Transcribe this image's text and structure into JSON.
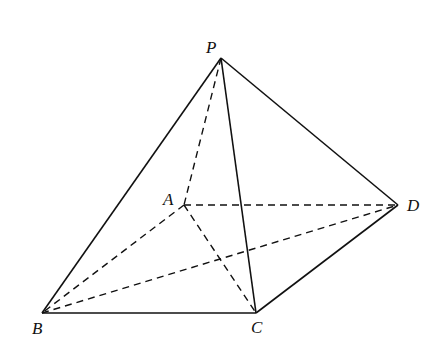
{
  "diagram": {
    "points": {
      "P": {
        "label": "P",
        "x": 221,
        "y": 58,
        "lx": 206,
        "ly": 53
      },
      "A": {
        "label": "A",
        "x": 184,
        "y": 205,
        "lx": 163,
        "ly": 205
      },
      "B": {
        "label": "B",
        "x": 42,
        "y": 313,
        "lx": 32,
        "ly": 334
      },
      "C": {
        "label": "C",
        "x": 256,
        "y": 313,
        "lx": 251,
        "ly": 333
      },
      "D": {
        "label": "D",
        "x": 398,
        "y": 205,
        "lx": 407,
        "ly": 211
      }
    },
    "solid_edges": [
      [
        "P",
        "B"
      ],
      [
        "P",
        "C"
      ],
      [
        "P",
        "D"
      ],
      [
        "B",
        "C"
      ],
      [
        "C",
        "D"
      ]
    ],
    "dashed_edges": [
      [
        "P",
        "A"
      ],
      [
        "A",
        "B"
      ],
      [
        "A",
        "D"
      ],
      [
        "A",
        "C"
      ],
      [
        "B",
        "D"
      ]
    ],
    "stroke_color": "#111111"
  }
}
